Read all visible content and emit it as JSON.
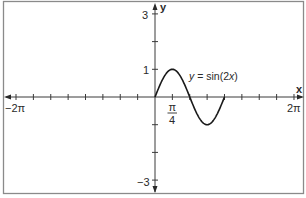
{
  "chart_data": {
    "type": "line",
    "title": "",
    "xlabel": "x",
    "ylabel": "y",
    "xlim": [
      -6.2832,
      6.2832
    ],
    "ylim": [
      -3,
      3
    ],
    "grid": false,
    "legend": "none",
    "x_tick_step": "π/4",
    "x_tick_labels": [
      {
        "value": -6.2832,
        "label": "−2π"
      },
      {
        "value": 0.7854,
        "label": "π/4"
      },
      {
        "value": 6.2832,
        "label": "2π"
      }
    ],
    "y_tick_labels": [
      {
        "value": 3,
        "label": "3"
      },
      {
        "value": 1,
        "label": "1"
      },
      {
        "value": -3,
        "label": "−3"
      }
    ],
    "y_ticks": [
      3,
      2,
      1,
      -1,
      -2,
      -3
    ],
    "series": [
      {
        "name": "y = sin(2x)",
        "domain": [
          0,
          3.1416
        ],
        "x": [
          0,
          0.3927,
          0.7854,
          1.1781,
          1.5708,
          1.9635,
          2.3562,
          2.7489,
          3.1416
        ],
        "values": [
          0,
          0.7071,
          1,
          0.7071,
          0,
          -0.7071,
          -1,
          -0.7071,
          0
        ]
      }
    ],
    "annotations": [
      {
        "text": "y = sin(2x)",
        "near": "peak at x = π/4"
      }
    ]
  },
  "labels": {
    "y_axis": "y",
    "x_axis": "x",
    "y_top": "3",
    "y_one": "1",
    "y_bottom": "−3",
    "x_left": "−2π",
    "x_right": "2π",
    "x_pi": "π",
    "x_four": "4",
    "curve_y": "y",
    "curve_eq": " = sin(2",
    "curve_x": "x",
    "curve_close": ")"
  },
  "colors": {
    "frame": "#7a7a7a",
    "axis": "#3a3a3a",
    "curve": "#1a1a1a"
  }
}
